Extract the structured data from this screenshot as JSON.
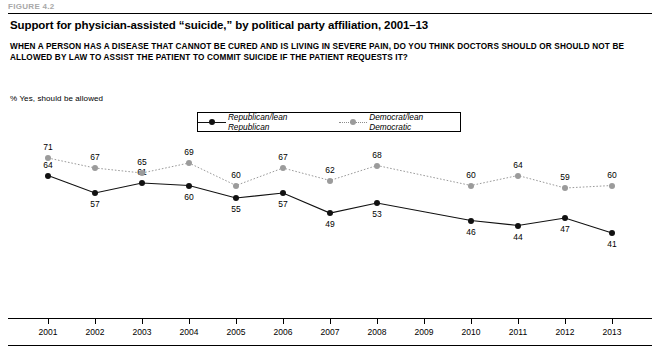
{
  "figure_label": "FIGURE 4.2",
  "title": "Support for physician-assisted “suicide,” by political party affiliation, 2001–13",
  "question": "WHEN A PERSON HAS A DISEASE THAT CANNOT BE CURED AND IS LIVING IN SEVERE PAIN, DO YOU THINK DOCTORS SHOULD OR SHOULD NOT BE ALLOWED BY LAW TO ASSIST THE PATIENT TO COMMIT SUICIDE IF THE PATIENT REQUESTS IT?",
  "subnote": "% Yes, should be allowed",
  "legend": {
    "items": [
      {
        "label": "Republican/lean Republican",
        "style": "solid",
        "color": "#111111"
      },
      {
        "label": "Democrat/lean Democratic",
        "style": "dotted",
        "color": "#9b9b9b"
      }
    ]
  },
  "chart_data": {
    "type": "line",
    "title": "Support for physician-assisted “suicide,” by political party affiliation, 2001–13",
    "xlabel": "",
    "ylabel": "% Yes, should be allowed",
    "ylim": [
      35,
      75
    ],
    "grid": false,
    "legend_position": "top-center",
    "categories": [
      "2001",
      "2002",
      "2003",
      "2004",
      "2005",
      "2006",
      "2007",
      "2008",
      "2009",
      "2010",
      "2011",
      "2012",
      "2013"
    ],
    "series": [
      {
        "name": "Republican/lean Republican",
        "color": "#111111",
        "style": "solid",
        "values": [
          64,
          57,
          61,
          60,
          55,
          57,
          49,
          53,
          null,
          46,
          44,
          47,
          41
        ]
      },
      {
        "name": "Democrat/lean Democratic",
        "color": "#9b9b9b",
        "style": "dotted",
        "values": [
          71,
          67,
          65,
          69,
          60,
          67,
          62,
          68,
          null,
          60,
          64,
          59,
          60
        ]
      }
    ]
  }
}
